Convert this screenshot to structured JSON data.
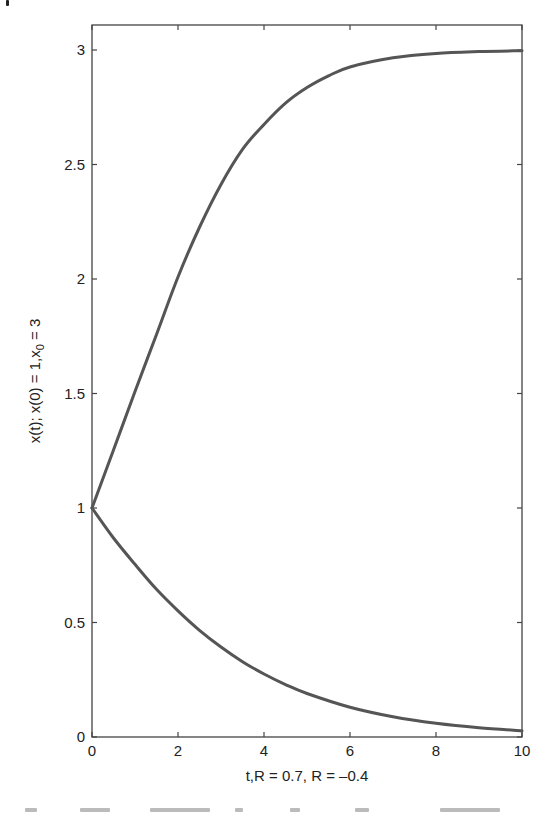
{
  "chart_data": {
    "type": "line",
    "title": "",
    "xlabel": "t,R = 0.7, R = –0.4",
    "ylabel": "x(t); x(0) = 1,x",
    "ylabel_subscript": "0",
    "ylabel_suffix": " = 3",
    "xlim": [
      0,
      10
    ],
    "ylim": [
      0,
      3.1
    ],
    "x_ticks": [
      0,
      2,
      4,
      6,
      8,
      10
    ],
    "x_tick_labels": [
      "0",
      "2",
      "4",
      "6",
      "8",
      "10"
    ],
    "y_ticks": [
      0,
      0.5,
      1,
      1.5,
      2,
      2.5,
      3
    ],
    "y_tick_labels": [
      "0",
      "0.5",
      "1",
      "1.5",
      "2",
      "2.5",
      "3"
    ],
    "grid": false,
    "legend": null,
    "line_color": "#555555",
    "series": [
      {
        "name": "R = 0.7",
        "x": [
          0,
          0.5,
          1,
          1.5,
          2,
          2.5,
          3,
          3.5,
          4,
          4.5,
          5,
          5.5,
          6,
          7,
          8,
          9,
          10
        ],
        "y": [
          1.0,
          1.253,
          1.509,
          1.758,
          2.009,
          2.226,
          2.413,
          2.566,
          2.675,
          2.768,
          2.836,
          2.887,
          2.926,
          2.966,
          2.985,
          2.993,
          2.997
        ]
      },
      {
        "name": "R = -0.4",
        "x": [
          0,
          0.5,
          1,
          1.5,
          2,
          2.5,
          3,
          3.5,
          4,
          4.5,
          5,
          6,
          7,
          8,
          9,
          10
        ],
        "y": [
          1.0,
          0.869,
          0.754,
          0.645,
          0.551,
          0.466,
          0.393,
          0.329,
          0.275,
          0.229,
          0.19,
          0.13,
          0.0885,
          0.0599,
          0.0404,
          0.0272
        ]
      }
    ]
  }
}
